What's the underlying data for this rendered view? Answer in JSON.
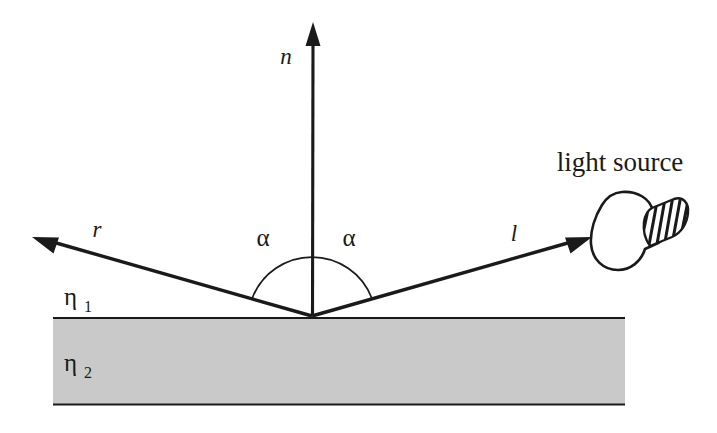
{
  "figure": {
    "background_color": "#ffffff",
    "ink_color": "#1a1a1a",
    "slab_fill_color": "#c9c9c9"
  },
  "labels": {
    "normal_vector": "n",
    "reflection_vector": "r",
    "light_vector": "l",
    "angle_left": "α",
    "angle_right": "α",
    "eta_upper_symbol": "η",
    "eta_upper_subscript": "1",
    "eta_lower_symbol": "η",
    "eta_lower_subscript": "2",
    "light_source": "light source"
  },
  "geometry": {
    "origin_x": 312,
    "origin_y": 316,
    "normal_tip_x": 313,
    "normal_tip_y": 22,
    "reflection_tip_x": 32,
    "reflection_tip_y": 238,
    "light_tip_x": 592,
    "light_tip_y": 238,
    "arc_radius": 64,
    "slab_left": 53,
    "slab_right": 625,
    "slab_top": 317,
    "slab_bottom": 405,
    "angle_degrees": 45
  }
}
